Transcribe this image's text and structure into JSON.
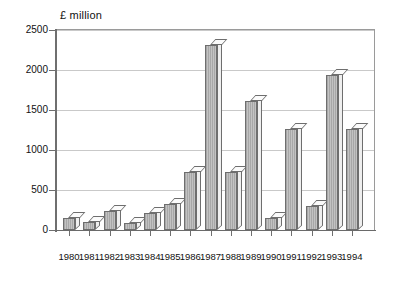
{
  "chart_data": {
    "type": "bar",
    "title": "£ million",
    "subtitle": "",
    "xlabel": "",
    "ylabel": "£ million",
    "ylim": [
      0,
      2500
    ],
    "ytick_step": 500,
    "grid": true,
    "legend": "none",
    "style": "3d-bar",
    "categories": [
      "1980",
      "1981",
      "1982",
      "1983",
      "1984",
      "1985",
      "1986",
      "1987",
      "1988",
      "1989",
      "1990",
      "1991",
      "1992",
      "1993",
      "1994"
    ],
    "values": [
      150,
      95,
      240,
      90,
      210,
      330,
      730,
      2310,
      720,
      1610,
      145,
      1265,
      300,
      1940,
      1265
    ],
    "ytick_labels": [
      "0",
      "500",
      "1000",
      "1500",
      "2000",
      "2500"
    ],
    "ytick_values": [
      0,
      500,
      1000,
      1500,
      2000,
      2500
    ]
  },
  "axis": {
    "unit_label": "£ million"
  }
}
